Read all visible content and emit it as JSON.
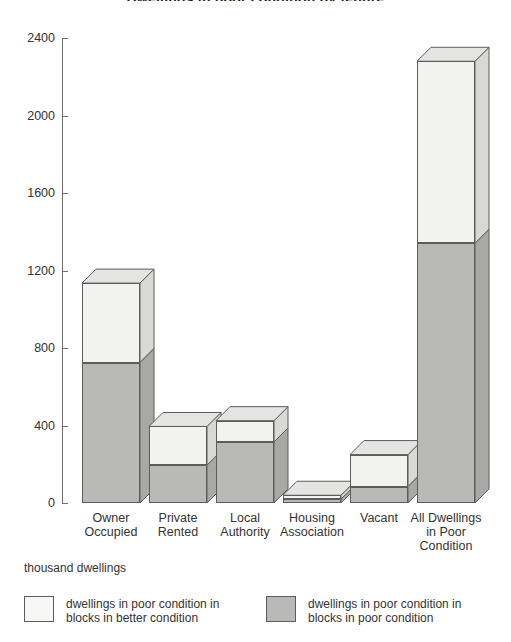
{
  "chart_data": {
    "type": "bar",
    "title": "Dwellings in poor condition by tenure",
    "subtitle": "",
    "xlabel": "",
    "ylabel": "thousand dwellings",
    "ylim": [
      0,
      2400
    ],
    "yticks": [
      0,
      400,
      800,
      1200,
      1600,
      2000,
      2400
    ],
    "grid": false,
    "legend_position": "bottom",
    "stacked": true,
    "style": "3d-bars",
    "categories": [
      "Owner Occupied",
      "Private Rented",
      "Local Authority",
      "Housing Association",
      "Vacant",
      "All Dwellings in Poor Condition"
    ],
    "series": [
      {
        "name": "dwellings in poor condition in blocks in poor condition",
        "color": "#b9b9b7",
        "values": [
          725,
          195,
          315,
          20,
          85,
          1340
        ]
      },
      {
        "name": "dwellings in poor condition in blocks in better condition",
        "color": "#f2f2f0",
        "values": [
          410,
          200,
          110,
          20,
          165,
          940
        ]
      }
    ],
    "totals": [
      1135,
      395,
      425,
      40,
      250,
      2280
    ],
    "annotations": []
  },
  "axis": {
    "caption": "thousand dwellings",
    "tick_labels": [
      "2400",
      "2000",
      "1600",
      "1200",
      "800",
      "400",
      "0"
    ]
  },
  "category_labels": [
    {
      "lines": [
        "Owner",
        "Occupied"
      ]
    },
    {
      "lines": [
        "Private",
        "Rented"
      ]
    },
    {
      "lines": [
        "Local",
        "Authority"
      ]
    },
    {
      "lines": [
        "Housing",
        "Association"
      ]
    },
    {
      "lines": [
        "Vacant"
      ]
    },
    {
      "lines": [
        "All Dwellings",
        "in Poor",
        "Condition"
      ]
    }
  ],
  "legend": {
    "items": [
      {
        "swatch": "light",
        "line1": "dwellings in poor condition in",
        "line2": "blocks in better condition"
      },
      {
        "swatch": "dark",
        "line1": "dwellings in poor condition in",
        "line2": "blocks in poor condition"
      }
    ]
  }
}
